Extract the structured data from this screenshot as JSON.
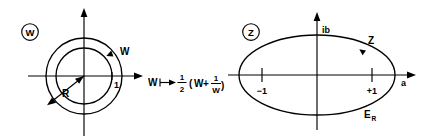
{
  "figure": {
    "type": "conformal-mapping-diagram",
    "background_color": "#ffffff",
    "line_color": "#000000",
    "width": 433,
    "height": 140
  },
  "w_plane": {
    "plane_label": "W",
    "circle_trace_label": "W",
    "radius_label": "R",
    "unit_tick_label": "1",
    "geometry": {
      "center_x": 84,
      "center_y": 76,
      "inner_radius": 28,
      "outer_radius": 38,
      "axis_x_start": 28,
      "axis_x_end": 143,
      "axis_y_start": 8,
      "axis_y_end": 136
    }
  },
  "transform": {
    "source_symbol": "W",
    "arrow_glyph": "⟼",
    "coefficient_numerator": "1",
    "coefficient_denominator": "2",
    "open_paren": "(",
    "term_one": "W",
    "plus": "+",
    "reciprocal_numerator": "1",
    "reciprocal_denominator": "W",
    "close_paren": ")",
    "full_text": "W ⟼ 1/2 (W + 1/W)"
  },
  "z_plane": {
    "plane_label": "Z",
    "imaginary_axis_label": "ib",
    "real_axis_label": "a",
    "ellipse_trace_label": "Z",
    "ellipse_name_label": "E",
    "ellipse_name_subscript": "R",
    "tick_negative_label": "−1",
    "tick_positive_label": "+1",
    "geometry": {
      "center_x": 317,
      "center_y": 75,
      "semi_major": 78,
      "semi_minor": 40,
      "axis_x_start": 228,
      "axis_x_end": 416,
      "axis_y_start": 12,
      "axis_y_end": 130,
      "tick_negative_x": 262,
      "tick_positive_x": 372
    }
  }
}
